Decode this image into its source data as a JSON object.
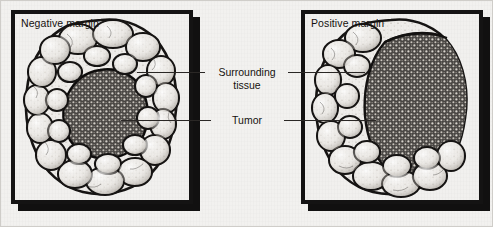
{
  "figure": {
    "type": "medical-illustration",
    "background_color": "#f2f1ef",
    "ink_color": "#141313"
  },
  "panels": [
    {
      "id": "negative-margin",
      "label": "Negative margin",
      "description": "Tumor core fully surrounded by a rim of normal tissue",
      "tumor_reaches_edge": false
    },
    {
      "id": "positive-margin",
      "label": "Positive margin",
      "description": "Tumor core extends to the cut edge of the specimen",
      "tumor_reaches_edge": true
    }
  ],
  "annotations": [
    {
      "id": "surrounding-tissue",
      "line1": "Surrounding",
      "line2": "tissue"
    },
    {
      "id": "tumor",
      "line1": "Tumor",
      "line2": ""
    }
  ]
}
